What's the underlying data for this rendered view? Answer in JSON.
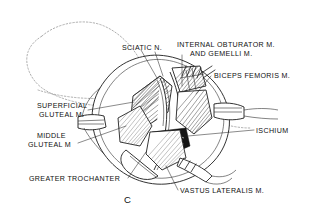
{
  "figure": {
    "letter": "C",
    "caption_style": "surgical-approach-illustration",
    "accent_color": "#101010",
    "background_color": "#ffffff"
  },
  "labels": {
    "sciatic_nerve": "SCIATIC N.",
    "internal_obturator_line1": "INTERNAL OBTURATOR M.",
    "internal_obturator_line2": "AND GEMELLI M.",
    "biceps_femoris": "BICEPS FEMORIS M.",
    "ischium": "ISCHIUM",
    "superficial_gluteal_line1": "SUPERFICIAL",
    "superficial_gluteal_line2": "GLUTEAL M.",
    "middle_gluteal_line1": "MIDDLE",
    "middle_gluteal_line2": "GLUTEAL M",
    "greater_trochanter": "GREATER TROCHANTER",
    "vastus_lateralis": "VASTUS LATERALIS M."
  }
}
